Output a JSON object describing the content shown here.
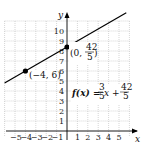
{
  "chart_data": {
    "type": "line",
    "title": "",
    "xlabel": "x",
    "ylabel": "y",
    "xlim": [
      -6,
      6
    ],
    "ylim": [
      0,
      11
    ],
    "x_ticks": [
      "-5",
      "-4",
      "-3",
      "-2",
      "-1",
      "1",
      "2",
      "3",
      "4",
      "5"
    ],
    "y_ticks": [
      "1",
      "2",
      "3",
      "4",
      "5",
      "6",
      "7",
      "8",
      "9",
      "10"
    ],
    "grid": true,
    "series": [
      {
        "name": "f(x) = 3/5 x + 42/5",
        "slope": 0.6,
        "intercept": 8.4,
        "x": [
          -6,
          6
        ],
        "y": [
          4.8,
          12.0
        ]
      }
    ],
    "points": [
      {
        "label": "(-4, 6)",
        "x": -4,
        "y": 6
      },
      {
        "label": "(0, 42/5)",
        "x": 0,
        "y": 8.4
      }
    ],
    "annotations": {
      "function_label": "f(x) = ",
      "point_a": "(−4, 6)",
      "point_b_prefix": "(0, ",
      "point_b_num": "42",
      "point_b_den": "5",
      "frac1_num": "3",
      "frac1_den": "5",
      "frac2_num": "42",
      "frac2_den": "5"
    }
  }
}
